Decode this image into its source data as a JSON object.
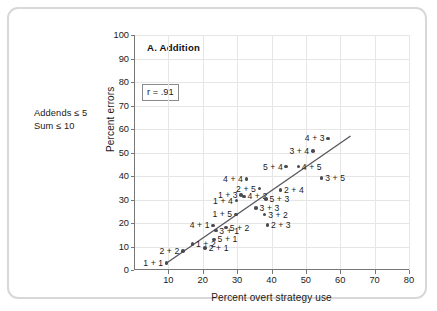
{
  "card": {
    "side_note_line1": "Addends ≤ 5",
    "side_note_line2": "Sum ≤ 10"
  },
  "chart_data": {
    "type": "scatter",
    "title": "A. Addition",
    "xlabel": "Percent overt strategy use",
    "ylabel": "Percent errors",
    "xlim": [
      0,
      80
    ],
    "ylim": [
      0,
      100
    ],
    "xticks": [
      10,
      20,
      30,
      40,
      50,
      60,
      70,
      80
    ],
    "yticks": [
      0,
      10,
      20,
      30,
      40,
      50,
      60,
      70,
      80,
      90,
      100
    ],
    "grid": true,
    "legend": "none",
    "annotation": "r = .91",
    "correlation": 0.91,
    "trendline": {
      "x0": 9.5,
      "y0": 3.0,
      "x1": 63.0,
      "y1": 57.0
    },
    "point_label_key": "addition problem (addend + addend)",
    "points": [
      {
        "label": "1 + 1",
        "x": 9.5,
        "y": 3.0,
        "side": "left"
      },
      {
        "label": "2 + 2",
        "x": 14.2,
        "y": 8.0,
        "side": "left"
      },
      {
        "label": "1 + 2",
        "x": 17.0,
        "y": 11.0,
        "side": "right"
      },
      {
        "label": "2 + 1",
        "x": 20.7,
        "y": 9.3,
        "side": "right"
      },
      {
        "label": "5 + 1",
        "x": 23.3,
        "y": 13.0,
        "side": "right"
      },
      {
        "label": "3 + 1",
        "x": 23.8,
        "y": 16.8,
        "side": "right"
      },
      {
        "label": "4 + 1",
        "x": 23.0,
        "y": 19.0,
        "side": "left"
      },
      {
        "label": "5 + 2",
        "x": 26.8,
        "y": 18.0,
        "side": "right"
      },
      {
        "label": "1 + 5",
        "x": 29.6,
        "y": 23.7,
        "side": "left"
      },
      {
        "label": "1 + 4",
        "x": 29.8,
        "y": 29.5,
        "side": "left"
      },
      {
        "label": "1 + 3",
        "x": 31.2,
        "y": 32.0,
        "side": "left"
      },
      {
        "label": "4 + 2",
        "x": 32.0,
        "y": 31.3,
        "side": "right"
      },
      {
        "label": "4 + 4",
        "x": 32.7,
        "y": 38.6,
        "side": "left"
      },
      {
        "label": "3 + 3",
        "x": 35.5,
        "y": 26.5,
        "side": "right"
      },
      {
        "label": "3 + 2",
        "x": 38.0,
        "y": 23.6,
        "side": "right"
      },
      {
        "label": "2 + 3",
        "x": 38.8,
        "y": 19.2,
        "side": "right"
      },
      {
        "label": "5 + 3",
        "x": 38.4,
        "y": 30.2,
        "side": "right"
      },
      {
        "label": "2 + 5",
        "x": 36.5,
        "y": 34.6,
        "side": "left"
      },
      {
        "label": "2 + 4",
        "x": 42.6,
        "y": 34.0,
        "side": "right"
      },
      {
        "label": "5 + 4",
        "x": 44.3,
        "y": 44.0,
        "side": "left"
      },
      {
        "label": "3 + 4",
        "x": 52.0,
        "y": 50.7,
        "side": "left"
      },
      {
        "label": "4 + 3",
        "x": 56.5,
        "y": 56.0,
        "side": "left"
      },
      {
        "label": "4 + 5",
        "x": 47.8,
        "y": 44.0,
        "side": "right"
      },
      {
        "label": "3 + 5",
        "x": 54.6,
        "y": 39.2,
        "side": "right"
      }
    ]
  }
}
